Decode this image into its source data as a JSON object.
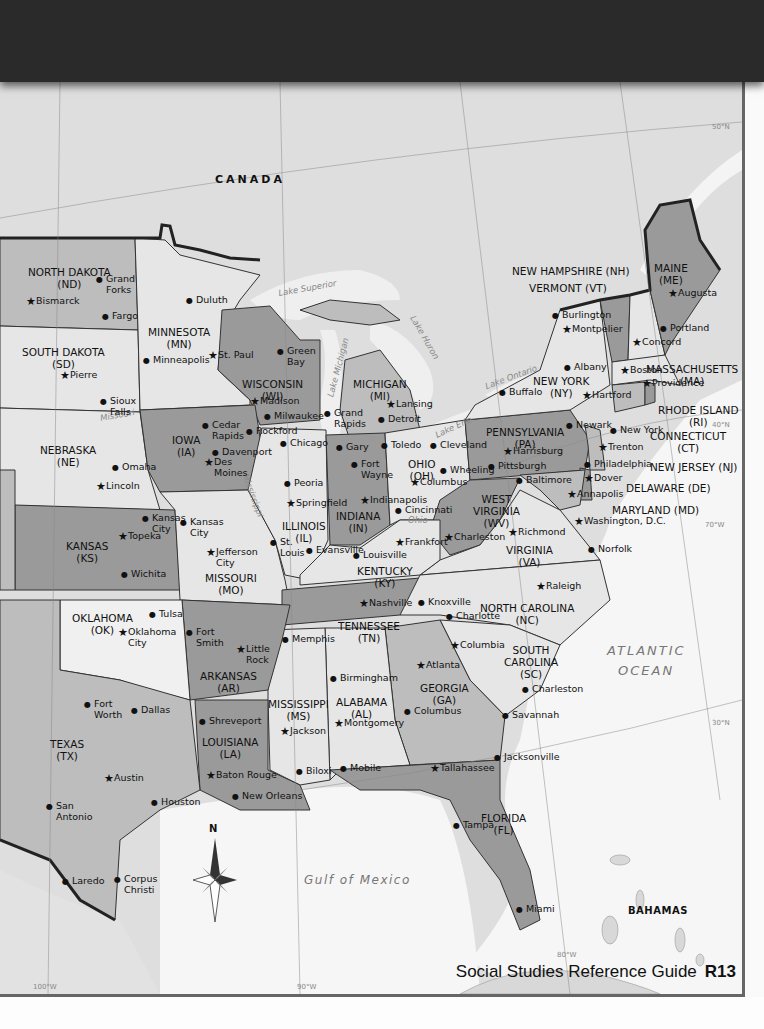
{
  "header": {
    "background": "#2a2a2a"
  },
  "colors": {
    "dark_state": "#9a9a9a",
    "light_state": "#e4e4e4",
    "mid_state": "#bdbdbd",
    "water": "#f4f4f4",
    "canada": "#dcdcdc",
    "border": "#222222"
  },
  "countries": {
    "canada": "CANADA",
    "bahamas": "BAHAMAS"
  },
  "water_bodies": {
    "atlantic_1": "ATLANTIC",
    "atlantic_2": "OCEAN",
    "gulf": "Gulf of Mexico",
    "superior": "Lake Superior",
    "michigan": "Lake Michigan",
    "huron": "Lake Huron",
    "ontario": "Lake Ontario",
    "erie": "Lake Erie",
    "missouri_river": "Missouri",
    "mississippi_river": "Mississippi",
    "ohio_river": "Ohio",
    "river": "River"
  },
  "grid_labels": {
    "lat50": "50°N",
    "lat40": "40°N",
    "lat30": "30°N",
    "lon70": "70°W",
    "lon80": "80°W",
    "lon90": "90°W",
    "lon100": "100°W"
  },
  "compass": {
    "north": "N"
  },
  "states": {
    "nd": "NORTH DAKOTA\n(ND)",
    "sd": "SOUTH DAKOTA\n(SD)",
    "mn": "MINNESOTA\n(MN)",
    "wi": "WISCONSIN\n(WI)",
    "mi": "MICHIGAN\n(MI)",
    "ne": "NEBRASKA\n(NE)",
    "ia": "IOWA\n(IA)",
    "ks": "KANSAS\n(KS)",
    "mo": "MISSOURI\n(MO)",
    "il": "ILLINOIS\n(IL)",
    "in": "INDIANA\n(IN)",
    "oh": "OHIO\n(OH)",
    "ky": "KENTUCKY\n(KY)",
    "wv": "WEST\nVIRGINIA\n(WV)",
    "va": "VIRGINIA\n(VA)",
    "pa": "PENNSYLVANIA\n(PA)",
    "ny": "NEW YORK\n(NY)",
    "ok": "OKLAHOMA\n(OK)",
    "tx": "TEXAS\n(TX)",
    "ar": "ARKANSAS\n(AR)",
    "la": "LOUISIANA\n(LA)",
    "ms": "MISSISSIPPI\n(MS)",
    "al": "ALABAMA\n(AL)",
    "tn": "TENNESSEE\n(TN)",
    "ga": "GEORGIA\n(GA)",
    "sc": "SOUTH\nCAROLINA\n(SC)",
    "nc": "NORTH CAROLINA\n(NC)",
    "fl": "FLORIDA\n(FL)",
    "me": "MAINE\n(ME)",
    "nh": "NEW HAMPSHIRE (NH)",
    "vt": "VERMONT (VT)",
    "ma": "MASSACHUSETTS\n(MA)",
    "ri": "RHODE ISLAND\n(RI)",
    "ct": "CONNECTICUT\n(CT)",
    "nj": "NEW JERSEY (NJ)",
    "de": "DELAWARE (DE)",
    "md": "MARYLAND (MD)"
  },
  "cities": [
    {
      "name": "Bismarck",
      "capital": true,
      "x": 30,
      "y": 302
    },
    {
      "name": "Grand\nForks",
      "capital": false,
      "x": 100,
      "y": 280
    },
    {
      "name": "Fargo",
      "capital": false,
      "x": 106,
      "y": 317
    },
    {
      "name": "Pierre",
      "capital": true,
      "x": 64,
      "y": 376
    },
    {
      "name": "Sioux\nFalls",
      "capital": false,
      "x": 104,
      "y": 402
    },
    {
      "name": "Duluth",
      "capital": false,
      "x": 190,
      "y": 301
    },
    {
      "name": "Minneapolis",
      "capital": false,
      "x": 147,
      "y": 361
    },
    {
      "name": "St. Paul",
      "capital": true,
      "x": 212,
      "y": 356
    },
    {
      "name": "Green\nBay",
      "capital": false,
      "x": 281,
      "y": 352
    },
    {
      "name": "Madison",
      "capital": true,
      "x": 254,
      "y": 402
    },
    {
      "name": "Milwaukee",
      "capital": false,
      "x": 268,
      "y": 417
    },
    {
      "name": "Lansing",
      "capital": true,
      "x": 390,
      "y": 405
    },
    {
      "name": "Grand\nRapids",
      "capital": false,
      "x": 328,
      "y": 414
    },
    {
      "name": "Detroit",
      "capital": false,
      "x": 382,
      "y": 420
    },
    {
      "name": "Cedar\nRapids",
      "capital": false,
      "x": 206,
      "y": 426
    },
    {
      "name": "Rockford",
      "capital": false,
      "x": 250,
      "y": 432
    },
    {
      "name": "Davenport",
      "capital": false,
      "x": 216,
      "y": 453
    },
    {
      "name": "Des\nMoines",
      "capital": true,
      "x": 208,
      "y": 463
    },
    {
      "name": "Chicago",
      "capital": false,
      "x": 284,
      "y": 444
    },
    {
      "name": "Gary",
      "capital": false,
      "x": 340,
      "y": 448
    },
    {
      "name": "Fort\nWayne",
      "capital": false,
      "x": 355,
      "y": 465
    },
    {
      "name": "Toledo",
      "capital": false,
      "x": 385,
      "y": 446
    },
    {
      "name": "Cleveland",
      "capital": false,
      "x": 434,
      "y": 446
    },
    {
      "name": "Buffalo",
      "capital": false,
      "x": 503,
      "y": 393
    },
    {
      "name": "Albany",
      "capital": false,
      "x": 568,
      "y": 368
    },
    {
      "name": "Burlington",
      "capital": false,
      "x": 556,
      "y": 316
    },
    {
      "name": "Montpelier",
      "capital": true,
      "x": 566,
      "y": 330
    },
    {
      "name": "Augusta",
      "capital": true,
      "x": 672,
      "y": 294
    },
    {
      "name": "Portland",
      "capital": false,
      "x": 664,
      "y": 329
    },
    {
      "name": "Concord",
      "capital": true,
      "x": 636,
      "y": 343
    },
    {
      "name": "Boston",
      "capital": true,
      "x": 624,
      "y": 371
    },
    {
      "name": "Providence",
      "capital": true,
      "x": 646,
      "y": 384
    },
    {
      "name": "Hartford",
      "capital": true,
      "x": 586,
      "y": 396
    },
    {
      "name": "Newark",
      "capital": false,
      "x": 570,
      "y": 426
    },
    {
      "name": "New York",
      "capital": false,
      "x": 614,
      "y": 431
    },
    {
      "name": "Trenton",
      "capital": true,
      "x": 602,
      "y": 448
    },
    {
      "name": "Philadelphia",
      "capital": false,
      "x": 588,
      "y": 465
    },
    {
      "name": "Dover",
      "capital": true,
      "x": 588,
      "y": 479
    },
    {
      "name": "Annapolis",
      "capital": true,
      "x": 571,
      "y": 495
    },
    {
      "name": "Baltimore",
      "capital": false,
      "x": 520,
      "y": 481
    },
    {
      "name": "Washington, D.C.",
      "capital": true,
      "x": 578,
      "y": 522
    },
    {
      "name": "Harrisburg",
      "capital": true,
      "x": 507,
      "y": 452
    },
    {
      "name": "Pittsburgh",
      "capital": false,
      "x": 492,
      "y": 467
    },
    {
      "name": "Wheeling",
      "capital": false,
      "x": 444,
      "y": 471
    },
    {
      "name": "Columbus",
      "capital": true,
      "x": 414,
      "y": 483
    },
    {
      "name": "Omaha",
      "capital": false,
      "x": 116,
      "y": 468
    },
    {
      "name": "Lincoln",
      "capital": true,
      "x": 100,
      "y": 487
    },
    {
      "name": "Peoria",
      "capital": false,
      "x": 288,
      "y": 484
    },
    {
      "name": "Springfield",
      "capital": true,
      "x": 290,
      "y": 504
    },
    {
      "name": "Indianapolis",
      "capital": true,
      "x": 364,
      "y": 501
    },
    {
      "name": "Cincinnati",
      "capital": false,
      "x": 399,
      "y": 511
    },
    {
      "name": "Kansas\nCity",
      "capital": false,
      "x": 146,
      "y": 519
    },
    {
      "name": "Kansas\nCity",
      "capital": false,
      "x": 184,
      "y": 523
    },
    {
      "name": "Topeka",
      "capital": true,
      "x": 122,
      "y": 537
    },
    {
      "name": "Jefferson\nCity",
      "capital": true,
      "x": 210,
      "y": 553
    },
    {
      "name": "St.\nLouis",
      "capital": false,
      "x": 274,
      "y": 543
    },
    {
      "name": "Evansville",
      "capital": false,
      "x": 310,
      "y": 551
    },
    {
      "name": "Louisville",
      "capital": false,
      "x": 357,
      "y": 556
    },
    {
      "name": "Frankfort",
      "capital": true,
      "x": 399,
      "y": 543
    },
    {
      "name": "Charleston",
      "capital": true,
      "x": 448,
      "y": 538
    },
    {
      "name": "Richmond",
      "capital": true,
      "x": 512,
      "y": 533
    },
    {
      "name": "Norfolk",
      "capital": false,
      "x": 592,
      "y": 550
    },
    {
      "name": "Wichita",
      "capital": false,
      "x": 125,
      "y": 575
    },
    {
      "name": "Tulsa",
      "capital": false,
      "x": 153,
      "y": 615
    },
    {
      "name": "Oklahoma\nCity",
      "capital": true,
      "x": 122,
      "y": 633
    },
    {
      "name": "Fort\nSmith",
      "capital": false,
      "x": 190,
      "y": 633
    },
    {
      "name": "Little\nRock",
      "capital": true,
      "x": 240,
      "y": 650
    },
    {
      "name": "Memphis",
      "capital": false,
      "x": 286,
      "y": 640
    },
    {
      "name": "Nashville",
      "capital": true,
      "x": 363,
      "y": 604
    },
    {
      "name": "Knoxville",
      "capital": false,
      "x": 422,
      "y": 603
    },
    {
      "name": "Raleigh",
      "capital": true,
      "x": 540,
      "y": 587
    },
    {
      "name": "Charlotte",
      "capital": false,
      "x": 450,
      "y": 617
    },
    {
      "name": "Columbia",
      "capital": true,
      "x": 454,
      "y": 646
    },
    {
      "name": "Atlanta",
      "capital": true,
      "x": 420,
      "y": 666
    },
    {
      "name": "Birmingham",
      "capital": false,
      "x": 334,
      "y": 679
    },
    {
      "name": "Montgomery",
      "capital": true,
      "x": 338,
      "y": 724
    },
    {
      "name": "Columbus",
      "capital": false,
      "x": 408,
      "y": 712
    },
    {
      "name": "Charleston",
      "capital": false,
      "x": 526,
      "y": 690
    },
    {
      "name": "Savannah",
      "capital": false,
      "x": 506,
      "y": 716
    },
    {
      "name": "Shreveport",
      "capital": false,
      "x": 203,
      "y": 722
    },
    {
      "name": "Jackson",
      "capital": true,
      "x": 284,
      "y": 732
    },
    {
      "name": "Fort\nWorth",
      "capital": false,
      "x": 88,
      "y": 705
    },
    {
      "name": "Dallas",
      "capital": false,
      "x": 135,
      "y": 711
    },
    {
      "name": "Austin",
      "capital": true,
      "x": 108,
      "y": 779
    },
    {
      "name": "San\nAntonio",
      "capital": false,
      "x": 50,
      "y": 807
    },
    {
      "name": "Houston",
      "capital": false,
      "x": 155,
      "y": 803
    },
    {
      "name": "Baton Rouge",
      "capital": true,
      "x": 210,
      "y": 776
    },
    {
      "name": "New Orleans",
      "capital": false,
      "x": 236,
      "y": 797
    },
    {
      "name": "Biloxi",
      "capital": false,
      "x": 300,
      "y": 772
    },
    {
      "name": "Mobile",
      "capital": false,
      "x": 344,
      "y": 769
    },
    {
      "name": "Tallahassee",
      "capital": true,
      "x": 434,
      "y": 769
    },
    {
      "name": "Jacksonville",
      "capital": false,
      "x": 498,
      "y": 758
    },
    {
      "name": "Tampa",
      "capital": false,
      "x": 457,
      "y": 826
    },
    {
      "name": "Miami",
      "capital": false,
      "x": 520,
      "y": 910
    },
    {
      "name": "Laredo",
      "capital": false,
      "x": 66,
      "y": 882
    },
    {
      "name": "Corpus\nChristi",
      "capital": false,
      "x": 118,
      "y": 880
    }
  ],
  "footer": {
    "guide": "Social Studies Reference Guide",
    "page": "R13"
  }
}
